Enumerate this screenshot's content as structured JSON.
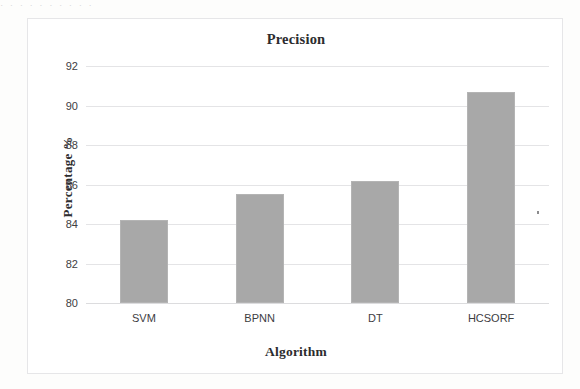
{
  "scan": {
    "top_clipped_text": "· ·  ·   · ·  · ·   ·    ·  ·",
    "background_color": "#fdfdfc",
    "frame_color": "#e6e6e8"
  },
  "chart_data": {
    "type": "bar",
    "title": "Precision",
    "xlabel": "Algorithm",
    "ylabel": "Percentage %",
    "categories": [
      "SVM",
      "BPNN",
      "DT",
      "HCSORF"
    ],
    "values": [
      84.2,
      85.5,
      86.2,
      90.7
    ],
    "ylim": [
      80,
      92
    ],
    "yticks": [
      80,
      82,
      84,
      86,
      88,
      90,
      92
    ],
    "ytick_labels": [
      "80",
      "82",
      "84",
      "86",
      "88",
      "90",
      "92"
    ],
    "grid": true,
    "legend": false,
    "bar_color": "#a8a8a8",
    "bar_border_color": "#b4b4b4"
  }
}
